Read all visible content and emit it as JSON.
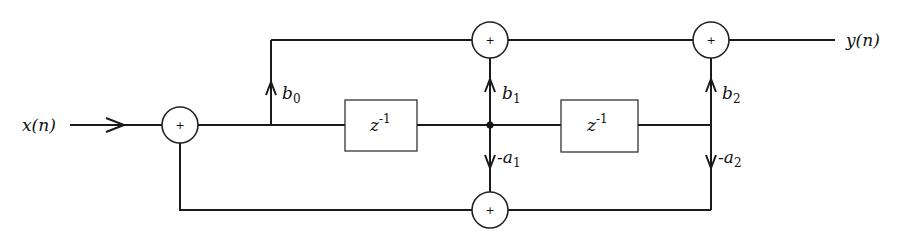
{
  "diagram": {
    "type": "signal-flow",
    "input_label": "x(n)",
    "output_label": "y(n)",
    "delays": [
      {
        "id": "delay1",
        "label": "z",
        "exp": "-1"
      },
      {
        "id": "delay2",
        "label": "z",
        "exp": "-1"
      }
    ],
    "coefficients": {
      "b0": {
        "sym": "b",
        "sub": "0"
      },
      "b1": {
        "sym": "b",
        "sub": "1"
      },
      "b2": {
        "sym": "b",
        "sub": "2"
      },
      "a1": {
        "sym": "-a",
        "sub": "1"
      },
      "a2": {
        "sym": "-a",
        "sub": "2"
      }
    },
    "adder_symbol": "+"
  }
}
